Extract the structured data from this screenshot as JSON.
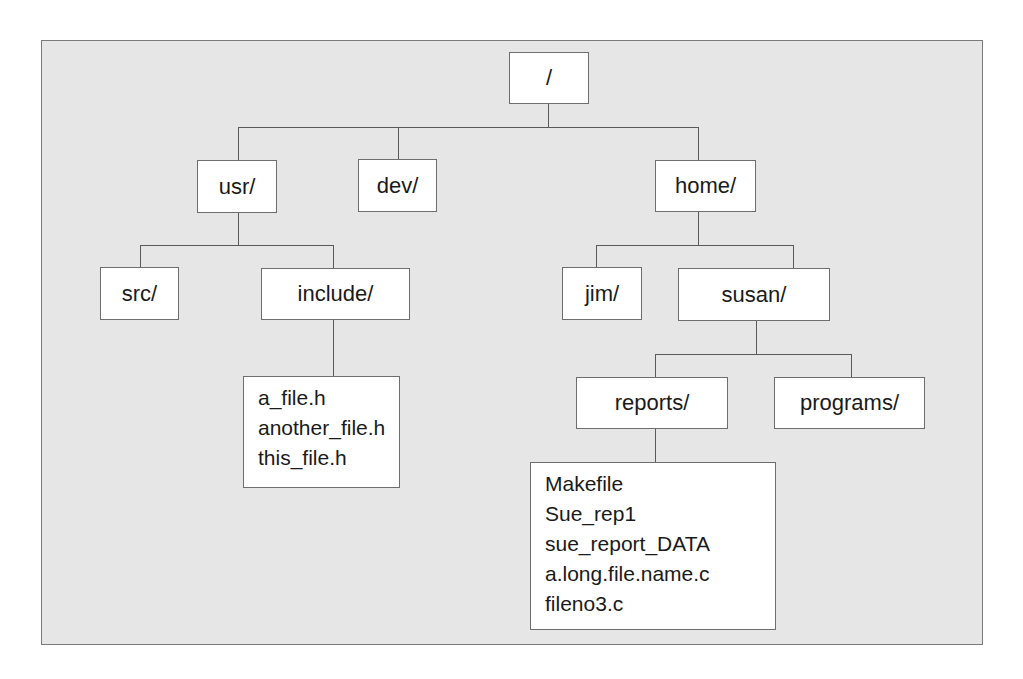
{
  "diagram": {
    "type": "directory-tree",
    "root": {
      "label": "/"
    },
    "level1": [
      {
        "id": "usr",
        "label": "usr/"
      },
      {
        "id": "dev",
        "label": "dev/"
      },
      {
        "id": "home",
        "label": "home/"
      }
    ],
    "usr_children": [
      {
        "id": "src",
        "label": "src/"
      },
      {
        "id": "include",
        "label": "include/"
      }
    ],
    "include_files": [
      "a_file.h",
      "another_file.h",
      "this_file.h"
    ],
    "home_children": [
      {
        "id": "jim",
        "label": "jim/"
      },
      {
        "id": "susan",
        "label": "susan/"
      }
    ],
    "susan_children": [
      {
        "id": "reports",
        "label": "reports/"
      },
      {
        "id": "programs",
        "label": "programs/"
      }
    ],
    "reports_files": [
      "Makefile",
      "Sue_rep1",
      "sue_report_DATA",
      "a.long.file.name.c",
      "fileno3.c"
    ],
    "colors": {
      "background": "#e6e6e6",
      "box": "#ffffff",
      "line": "#5a5a5a",
      "text": "#1a1a1a"
    }
  }
}
